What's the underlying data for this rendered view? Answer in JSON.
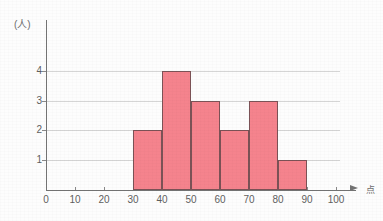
{
  "chart_data": {
    "type": "bar",
    "title": "",
    "subtitle": "",
    "xlabel": "点",
    "ylabel": "(人)",
    "x_unit_label": "点",
    "y_unit_label": "(人)",
    "categories": [
      "30-40",
      "40-50",
      "50-60",
      "60-70",
      "70-80",
      "80-90"
    ],
    "bin_edges": [
      30,
      40,
      50,
      60,
      70,
      80,
      90
    ],
    "values": [
      2,
      4,
      3,
      2,
      3,
      1
    ],
    "bar_color": "#f5838d",
    "bar_border_color": "#7b5256",
    "xlim": [
      0,
      100
    ],
    "ylim": [
      0,
      4.8
    ],
    "x_ticks": [
      0,
      10,
      20,
      30,
      40,
      50,
      60,
      70,
      80,
      90,
      100
    ],
    "x_tick_labels": [
      "0",
      "10",
      "20",
      "30",
      "40",
      "50",
      "60",
      "70",
      "80",
      "90",
      "100"
    ],
    "y_ticks": [
      1,
      2,
      3,
      4
    ],
    "y_tick_labels": [
      "1",
      "2",
      "3",
      "4"
    ],
    "grid": true,
    "grid_axis": "y",
    "legend": null,
    "legend_position": "none",
    "axis_color": "#737373",
    "grid_color": "#d5d5d5",
    "background_color": "#fdfdfd",
    "x_axis_has_arrow": true,
    "annotations": []
  }
}
